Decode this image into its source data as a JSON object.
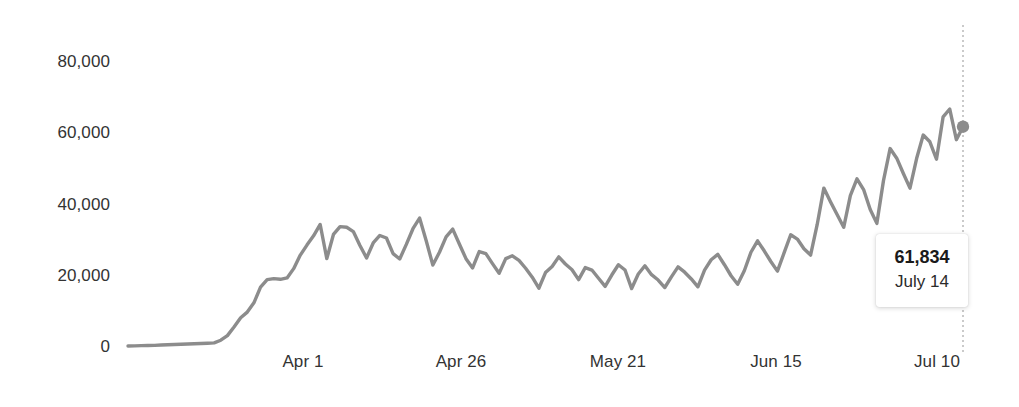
{
  "chart_data": {
    "type": "line",
    "title": "",
    "subtitle": "",
    "xlabel": "",
    "ylabel": "",
    "ylim": [
      0,
      88000
    ],
    "grid": false,
    "legend": null,
    "y_ticks": [
      0,
      20000,
      40000,
      60000,
      80000
    ],
    "y_tick_labels": [
      "0",
      "20,000",
      "40,000",
      "60,000",
      "80,000"
    ],
    "x_tick_labels": [
      "Apr 1",
      "Apr 26",
      "May 21",
      "Jun 15",
      "Jul 10"
    ],
    "x_tick_indices": [
      22,
      47,
      72,
      97,
      122
    ],
    "x_start_label": "Mar 10",
    "x_end_label": "July 14",
    "series": [
      {
        "name": "Daily new cases",
        "color": "#8c8c8c",
        "values": [
          260,
          320,
          380,
          420,
          470,
          560,
          640,
          700,
          760,
          840,
          900,
          980,
          1050,
          1150,
          1900,
          3200,
          5600,
          8200,
          9800,
          12400,
          16800,
          18900,
          19200,
          19000,
          19400,
          22000,
          25800,
          28600,
          31200,
          34400,
          24800,
          31600,
          33800,
          33600,
          32400,
          28500,
          25000,
          29200,
          31300,
          30600,
          26200,
          24700,
          28800,
          33200,
          36200,
          29800,
          23000,
          26600,
          30900,
          33100,
          28900,
          24800,
          22200,
          26800,
          26200,
          23400,
          20700,
          24800,
          25600,
          24300,
          22100,
          19600,
          16500,
          20900,
          22600,
          25300,
          23300,
          21700,
          18900,
          22300,
          21600,
          19300,
          17000,
          20200,
          23100,
          21600,
          16400,
          20500,
          22800,
          20300,
          18800,
          16700,
          19700,
          22500,
          21000,
          19100,
          16900,
          21600,
          24500,
          26000,
          23100,
          20000,
          17600,
          21400,
          26600,
          29800,
          27000,
          24000,
          21300,
          26400,
          31500,
          30300,
          27600,
          25800,
          34400,
          44600,
          40800,
          37200,
          33600,
          42500,
          47200,
          44200,
          38600,
          34700,
          46700,
          55700,
          53000,
          48700,
          44600,
          52900,
          59500,
          57600,
          52700,
          64600,
          66800,
          58200,
          61834
        ]
      }
    ],
    "highlight_point": {
      "index": 126,
      "value": 61834,
      "value_label": "61,834",
      "date_label": "July 14",
      "marker_color": "#8c8c8c"
    },
    "reference_line": {
      "orientation": "vertical",
      "at_index": 126,
      "style": "dotted",
      "color": "#bdbdbd"
    }
  },
  "tooltip": {
    "value": "61,834",
    "date": "July 14"
  },
  "axes": {
    "y_labels": [
      "80,000",
      "60,000",
      "40,000",
      "20,000",
      "0"
    ],
    "x_labels": [
      "Apr 1",
      "Apr 26",
      "May 21",
      "Jun 15",
      "Jul 10"
    ]
  }
}
